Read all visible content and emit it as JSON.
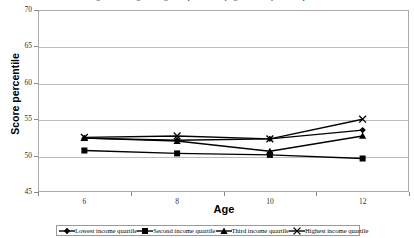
{
  "chart_data": {
    "type": "line",
    "title": "Figure 3. Average reading score percentile, by age and family income quartile",
    "xlabel": "Age",
    "ylabel": "Score percentile",
    "categories": [
      "6",
      "8",
      "10",
      "12"
    ],
    "ylim": [
      45,
      70
    ],
    "yticks": [
      45,
      50,
      55,
      60,
      65,
      70
    ],
    "grid": true,
    "legend_position": "bottom",
    "series": [
      {
        "name": "Lowest income quartile",
        "marker": "diamond",
        "values": [
          52.4,
          52.1,
          52.3,
          53.5
        ]
      },
      {
        "name": "Second income quartile",
        "marker": "square",
        "values": [
          50.7,
          50.3,
          50.1,
          49.6
        ]
      },
      {
        "name": "Third income quartile",
        "marker": "triangle",
        "values": [
          52.4,
          52.0,
          50.6,
          52.7
        ]
      },
      {
        "name": "Highest income quartile",
        "marker": "cross",
        "values": [
          52.5,
          52.7,
          52.3,
          55.0
        ]
      }
    ],
    "colors": {
      "series_line": "#000000",
      "gridline": "#bdbdbd",
      "frame": "#aaaaaa",
      "background": "#ffffff"
    }
  }
}
